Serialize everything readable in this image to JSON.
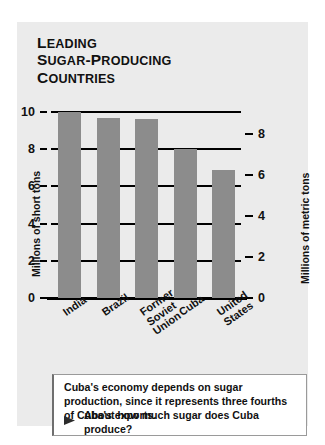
{
  "figure": {
    "title_lines": [
      "Leading",
      "Sugar-Producing",
      "Countries"
    ]
  },
  "chart_data": {
    "type": "bar",
    "title": "Leading Sugar-Producing Countries",
    "categories": [
      "India",
      "Brazil",
      "Former Soviet Union",
      "Cuba",
      "United States"
    ],
    "values": [
      10.0,
      9.7,
      9.6,
      8.0,
      6.9
    ],
    "xlabel": "",
    "ylabel": "Millions of short tons",
    "y2label": "Millions of metric tons",
    "ylim": [
      0,
      10
    ],
    "y2lim": [
      0,
      9.07
    ],
    "yticks": [
      "0",
      "2",
      "4",
      "6",
      "8",
      "10"
    ],
    "y2ticks": [
      "0",
      "2",
      "4",
      "6",
      "8"
    ],
    "grid": true,
    "legend": "none",
    "bar_color": "#8c8c8c",
    "panel_color": "#ebebeb",
    "axis_color": "#000000"
  },
  "axes": {
    "left_label": "Millions of short tons",
    "right_label": "Millions of metric tons",
    "left_ticks": [
      {
        "label": "10",
        "value": 10
      },
      {
        "label": "8",
        "value": 8
      },
      {
        "label": "6",
        "value": 6
      },
      {
        "label": "4",
        "value": 4
      },
      {
        "label": "2",
        "value": 2
      },
      {
        "label": "0",
        "value": 0
      }
    ],
    "right_ticks": [
      {
        "label": "8",
        "value": 8
      },
      {
        "label": "6",
        "value": 6
      },
      {
        "label": "4",
        "value": 4
      },
      {
        "label": "2",
        "value": 2
      },
      {
        "label": "0",
        "value": 0
      }
    ]
  },
  "categories": [
    {
      "line1": "India",
      "line2": "",
      "line3": ""
    },
    {
      "line1": "Brazil",
      "line2": "",
      "line3": ""
    },
    {
      "line1": "Former",
      "line2": "Soviet",
      "line3": "Union"
    },
    {
      "line1": "Cuba",
      "line2": "",
      "line3": ""
    },
    {
      "line1": "United",
      "line2": "States",
      "line3": ""
    }
  ],
  "caption": {
    "body": "Cuba's economy depends on sugar production, since it represents three fourths of Cuba's exports.",
    "bullet_icon": "triangle-right-icon",
    "question": "About how much sugar does Cuba produce?"
  }
}
